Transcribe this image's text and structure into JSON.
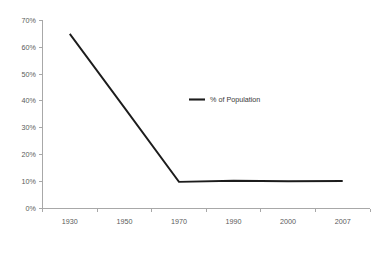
{
  "chart_data": {
    "type": "line",
    "title": "",
    "subtitle": "",
    "xlabel": "",
    "ylabel": "",
    "categories": [
      "1930",
      "1950",
      "1970",
      "1990",
      "2000",
      "2007"
    ],
    "series": [
      {
        "name": "% of Population",
        "values": [
          65,
          37.5,
          9.8,
          10.2,
          10.0,
          10.1
        ]
      }
    ],
    "x": [
      "1930",
      "1950",
      "1970",
      "1990",
      "2000",
      "2007"
    ],
    "ylim": [
      0,
      70
    ],
    "y_ticks": [
      0,
      10,
      20,
      30,
      40,
      50,
      60,
      70
    ],
    "y_tick_labels": [
      "0%",
      "10%",
      "20%",
      "30%",
      "40%",
      "50%",
      "60%",
      "70%"
    ],
    "x_tick_labels": [
      "1930",
      "1950",
      "1970",
      "1990",
      "2000",
      "2007"
    ],
    "grid": false,
    "legend": {
      "position": "inside-center",
      "entries": [
        "% of Population"
      ]
    },
    "annotations": [],
    "colors": {
      "series_line": "#1c1c1c",
      "axis": "#a8a8a8",
      "tick_text": "#5a5a5a",
      "legend_text": "#3a3a3a",
      "background": "#ffffff"
    }
  },
  "legend": {
    "label": "% of Population"
  },
  "axes": {
    "y": {
      "labels": [
        "70%",
        "60%",
        "50%",
        "40%",
        "30%",
        "20%",
        "10%",
        "0%"
      ]
    },
    "x": {
      "labels": [
        "1930",
        "1950",
        "1970",
        "1990",
        "2000",
        "2007"
      ]
    }
  }
}
